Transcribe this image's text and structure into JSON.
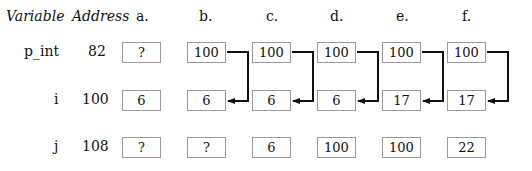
{
  "header": {
    "variable_label": "Variable",
    "address_label": "Address",
    "columns": [
      "a.",
      "b.",
      "c.",
      "d.",
      "e.",
      "f."
    ]
  },
  "rows": [
    {
      "variable": "p_int",
      "address": "82",
      "values": [
        "?",
        "100",
        "100",
        "100",
        "100",
        "100"
      ]
    },
    {
      "variable": "i",
      "address": "100",
      "values": [
        "6",
        "6",
        "6",
        "6",
        "17",
        "17"
      ]
    },
    {
      "variable": "j",
      "address": "108",
      "values": [
        "?",
        "?",
        "6",
        "100",
        "100",
        "22"
      ]
    }
  ],
  "arrows": {
    "description": "pointer from p_int box to i box in columns b-f",
    "columns": [
      "b.",
      "c.",
      "d.",
      "e.",
      "f."
    ],
    "color": "#111111"
  }
}
